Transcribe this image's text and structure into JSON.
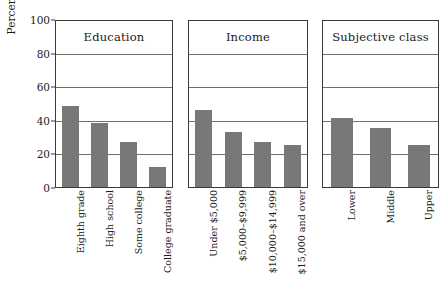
{
  "chart_data": {
    "type": "bar",
    "title": "",
    "xlabel": "",
    "ylabel": "Percent with high intolerance",
    "ylim": [
      0,
      100
    ],
    "yticks": [
      0,
      20,
      40,
      60,
      80,
      100
    ],
    "grid": true,
    "legend": "none",
    "bar_color": "#787878",
    "panels": [
      {
        "title": "Education",
        "categories": [
          "Eighth grade",
          "High school",
          "Some college",
          "College graduate"
        ],
        "values": [
          48,
          38,
          27,
          12
        ]
      },
      {
        "title": "Income",
        "categories": [
          "Under $5,000",
          "$5,000–$9,999",
          "$10,000–$14,999",
          "$15,000 and over"
        ],
        "values": [
          46,
          33,
          27,
          25
        ]
      },
      {
        "title": "Subjective class",
        "categories": [
          "Lower",
          "Middle",
          "Upper"
        ],
        "values": [
          41,
          35,
          25
        ]
      }
    ]
  }
}
